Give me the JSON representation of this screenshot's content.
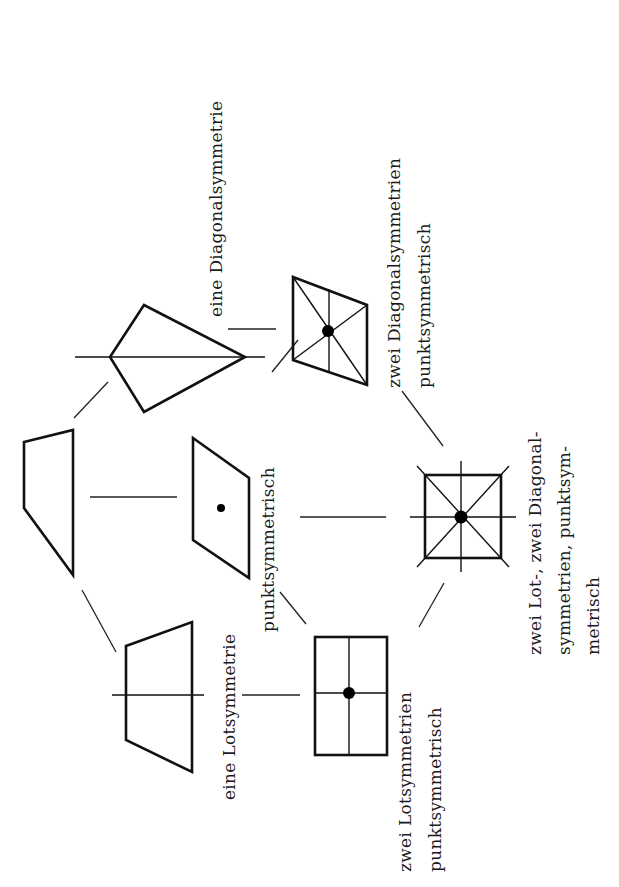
{
  "diagram": {
    "title": "",
    "orientation": "rotated -90deg (text reads bottom-to-top)",
    "labels": {
      "kite": "eine Diagonalsymmetrie",
      "lot_trapezoid": "eine Lotsymmetrie",
      "parallelogram": "punktsymmetrisch",
      "rhombus_line1": "zwei Diagonalsymmetrien",
      "rhombus_line2": "punktsymmetrisch",
      "rectangle_line1": "zwei Lotsymmetrien",
      "rectangle_line2": "punktsymmetrisch",
      "square_line1": "zwei Lot-, zwei Diagonal-",
      "square_line2": "symmetrien, punktsym-",
      "square_line3": "metrisch"
    },
    "nodes": [
      {
        "id": "general-quadrilateral",
        "shape": "trapezoid (irregular)",
        "symmetries": "none"
      },
      {
        "id": "kite",
        "shape": "kite",
        "symmetries": "one diagonal symmetry"
      },
      {
        "id": "parallelogram",
        "shape": "parallelogram",
        "symmetries": "point symmetric"
      },
      {
        "id": "isosceles-trapezoid",
        "shape": "isosceles trapezoid",
        "symmetries": "one perpendicular symmetry"
      },
      {
        "id": "rhombus",
        "shape": "rhombus",
        "symmetries": "two diagonal symmetries, point symmetric"
      },
      {
        "id": "rectangle",
        "shape": "rectangle",
        "symmetries": "two perpendicular symmetries, point symmetric"
      },
      {
        "id": "square",
        "shape": "square",
        "symmetries": "two perpendicular, two diagonal symmetries, point symmetric"
      }
    ],
    "edges": [
      [
        "general-quadrilateral",
        "kite"
      ],
      [
        "general-quadrilateral",
        "parallelogram"
      ],
      [
        "general-quadrilateral",
        "isosceles-trapezoid"
      ],
      [
        "kite",
        "rhombus"
      ],
      [
        "parallelogram",
        "rhombus"
      ],
      [
        "parallelogram",
        "rectangle"
      ],
      [
        "parallelogram",
        "square"
      ],
      [
        "isosceles-trapezoid",
        "rectangle"
      ],
      [
        "rhombus",
        "square"
      ],
      [
        "rectangle",
        "square"
      ]
    ],
    "colors": {
      "stroke": "#111111",
      "background": "#ffffff"
    }
  }
}
